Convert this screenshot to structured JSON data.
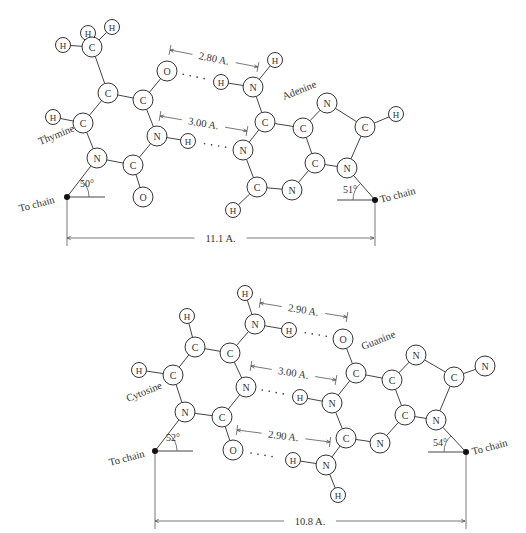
{
  "figure": {
    "top_pair": {
      "name": "thymine-adenine",
      "labels": {
        "left_base": "Thymine",
        "right_base": "Adenine"
      },
      "hbond_distances": [
        {
          "label": "2.80 A.",
          "x1": 170,
          "y1": 50,
          "x2": 258,
          "y2": 67
        },
        {
          "label": "3.00 A.",
          "x1": 160,
          "y1": 116,
          "x2": 247,
          "y2": 131
        }
      ],
      "chain_distance": {
        "label": "11.1 A.",
        "x1": 67,
        "x2": 374,
        "y": 238
      },
      "angles": [
        {
          "label": "50°",
          "x": 80,
          "y": 187
        },
        {
          "label": "51°",
          "x": 343,
          "y": 193
        }
      ],
      "chain_labels": [
        {
          "label": "To chain",
          "x": 20,
          "y": 212,
          "rot": -15
        },
        {
          "label": "To chain",
          "x": 381,
          "y": 203,
          "rot": -15
        }
      ],
      "chain_points": [
        {
          "x": 67,
          "y": 197
        },
        {
          "x": 375,
          "y": 200
        }
      ],
      "atoms": [
        {
          "id": "t_h1",
          "el": "H",
          "x": 63,
          "y": 45
        },
        {
          "id": "t_h2",
          "el": "H",
          "x": 88,
          "y": 33
        },
        {
          "id": "t_cm",
          "el": "C",
          "x": 92,
          "y": 47
        },
        {
          "id": "t_h3",
          "el": "H",
          "x": 112,
          "y": 27
        },
        {
          "id": "t_c5",
          "el": "C",
          "x": 108,
          "y": 93
        },
        {
          "id": "t_c4",
          "el": "C",
          "x": 143,
          "y": 100
        },
        {
          "id": "t_o4",
          "el": "O",
          "x": 167,
          "y": 71
        },
        {
          "id": "t_h6",
          "el": "H",
          "x": 53,
          "y": 117
        },
        {
          "id": "t_c6",
          "el": "C",
          "x": 83,
          "y": 123
        },
        {
          "id": "t_n3",
          "el": "N",
          "x": 157,
          "y": 136
        },
        {
          "id": "t_h3n",
          "el": "H",
          "x": 188,
          "y": 141
        },
        {
          "id": "t_n1",
          "el": "N",
          "x": 97,
          "y": 158
        },
        {
          "id": "t_c2",
          "el": "C",
          "x": 133,
          "y": 165
        },
        {
          "id": "t_o2",
          "el": "O",
          "x": 143,
          "y": 197
        },
        {
          "id": "a_h6a",
          "el": "H",
          "x": 221,
          "y": 82
        },
        {
          "id": "a_n6",
          "el": "N",
          "x": 253,
          "y": 87
        },
        {
          "id": "a_h6b",
          "el": "H",
          "x": 275,
          "y": 60
        },
        {
          "id": "a_c6",
          "el": "C",
          "x": 265,
          "y": 122
        },
        {
          "id": "a_n1",
          "el": "N",
          "x": 243,
          "y": 150
        },
        {
          "id": "a_c2",
          "el": "C",
          "x": 257,
          "y": 187
        },
        {
          "id": "a_h2",
          "el": "H",
          "x": 233,
          "y": 210
        },
        {
          "id": "a_n3",
          "el": "N",
          "x": 292,
          "y": 190
        },
        {
          "id": "a_c4",
          "el": "C",
          "x": 315,
          "y": 163
        },
        {
          "id": "a_c5",
          "el": "C",
          "x": 303,
          "y": 128
        },
        {
          "id": "a_n7",
          "el": "N",
          "x": 327,
          "y": 103
        },
        {
          "id": "a_c8",
          "el": "C",
          "x": 365,
          "y": 127
        },
        {
          "id": "a_h8",
          "el": "H",
          "x": 396,
          "y": 114
        },
        {
          "id": "a_n9",
          "el": "N",
          "x": 347,
          "y": 168
        }
      ],
      "bonds": [
        [
          "t_h1",
          "t_cm"
        ],
        [
          "t_h2",
          "t_cm"
        ],
        [
          "t_h3",
          "t_cm"
        ],
        [
          "t_cm",
          "t_c5"
        ],
        [
          "t_c5",
          "t_c4"
        ],
        [
          "t_c4",
          "t_o4"
        ],
        [
          "t_c5",
          "t_c6"
        ],
        [
          "t_h6",
          "t_c6"
        ],
        [
          "t_c6",
          "t_n1"
        ],
        [
          "t_c4",
          "t_n3"
        ],
        [
          "t_n3",
          "t_h3n"
        ],
        [
          "t_n3",
          "t_c2"
        ],
        [
          "t_n1",
          "t_c2"
        ],
        [
          "t_c2",
          "t_o2"
        ],
        [
          "a_h6a",
          "a_n6"
        ],
        [
          "a_n6",
          "a_h6b"
        ],
        [
          "a_n6",
          "a_c6"
        ],
        [
          "a_c6",
          "a_n1"
        ],
        [
          "a_n1",
          "a_c2"
        ],
        [
          "a_c2",
          "a_h2"
        ],
        [
          "a_c2",
          "a_n3"
        ],
        [
          "a_n3",
          "a_c4"
        ],
        [
          "a_c4",
          "a_c5"
        ],
        [
          "a_c5",
          "a_c6"
        ],
        [
          "a_c5",
          "a_n7"
        ],
        [
          "a_n7",
          "a_c8"
        ],
        [
          "a_c8",
          "a_h8"
        ],
        [
          "a_c8",
          "a_n9"
        ],
        [
          "a_n9",
          "a_c4"
        ]
      ],
      "hbonds": [
        [
          "t_o4",
          "a_h6a"
        ],
        [
          "t_h3n",
          "a_n1"
        ]
      ]
    },
    "bottom_pair": {
      "name": "cytosine-guanine",
      "labels": {
        "left_base": "Cytosine",
        "right_base": "Guanine"
      },
      "hbond_distances": [
        {
          "label": "2.90 A.",
          "x1": 260,
          "y1": 303,
          "x2": 347,
          "y2": 317
        },
        {
          "label": "3.00 A.",
          "x1": 251,
          "y1": 366,
          "x2": 336,
          "y2": 380
        },
        {
          "label": "2.90 A.",
          "x1": 237,
          "y1": 430,
          "x2": 330,
          "y2": 442
        }
      ],
      "chain_distance": {
        "label": "10.8 A.",
        "x1": 155,
        "x2": 465,
        "y": 521
      },
      "angles": [
        {
          "label": "52°",
          "x": 166,
          "y": 441
        },
        {
          "label": "54°",
          "x": 433,
          "y": 446
        }
      ],
      "chain_labels": [
        {
          "label": "To chain",
          "x": 110,
          "y": 466,
          "rot": -15
        },
        {
          "label": "To chain",
          "x": 473,
          "y": 455,
          "rot": -15
        }
      ],
      "chain_points": [
        {
          "x": 155,
          "y": 451
        },
        {
          "x": 466,
          "y": 452
        }
      ],
      "atoms": [
        {
          "id": "c_h5",
          "el": "H",
          "x": 187,
          "y": 316
        },
        {
          "id": "c_c5",
          "el": "C",
          "x": 195,
          "y": 347
        },
        {
          "id": "c_c4",
          "el": "C",
          "x": 230,
          "y": 353
        },
        {
          "id": "c_hn4a",
          "el": "H",
          "x": 245,
          "y": 293
        },
        {
          "id": "c_n4",
          "el": "N",
          "x": 255,
          "y": 324
        },
        {
          "id": "c_hn4b",
          "el": "H",
          "x": 289,
          "y": 330
        },
        {
          "id": "c_h6",
          "el": "H",
          "x": 139,
          "y": 370
        },
        {
          "id": "c_c6",
          "el": "C",
          "x": 173,
          "y": 375
        },
        {
          "id": "c_n3",
          "el": "N",
          "x": 246,
          "y": 387
        },
        {
          "id": "c_n1",
          "el": "N",
          "x": 185,
          "y": 412
        },
        {
          "id": "c_c2",
          "el": "C",
          "x": 222,
          "y": 417
        },
        {
          "id": "c_o2",
          "el": "O",
          "x": 233,
          "y": 450
        },
        {
          "id": "g_o6",
          "el": "O",
          "x": 343,
          "y": 339
        },
        {
          "id": "g_c6",
          "el": "C",
          "x": 356,
          "y": 373
        },
        {
          "id": "g_h1",
          "el": "H",
          "x": 300,
          "y": 397
        },
        {
          "id": "g_n1",
          "el": "N",
          "x": 332,
          "y": 403
        },
        {
          "id": "g_c2",
          "el": "C",
          "x": 346,
          "y": 438
        },
        {
          "id": "g_h2a",
          "el": "H",
          "x": 293,
          "y": 460
        },
        {
          "id": "g_n2",
          "el": "N",
          "x": 326,
          "y": 465
        },
        {
          "id": "g_h2b",
          "el": "H",
          "x": 338,
          "y": 495
        },
        {
          "id": "g_n3",
          "el": "N",
          "x": 380,
          "y": 443
        },
        {
          "id": "g_c4",
          "el": "C",
          "x": 405,
          "y": 415
        },
        {
          "id": "g_c5",
          "el": "C",
          "x": 392,
          "y": 380
        },
        {
          "id": "g_n7",
          "el": "N",
          "x": 416,
          "y": 355
        },
        {
          "id": "g_c8",
          "el": "C",
          "x": 454,
          "y": 377
        },
        {
          "id": "g_n8",
          "el": "N",
          "x": 485,
          "y": 366
        },
        {
          "id": "g_n9",
          "el": "N",
          "x": 436,
          "y": 420
        }
      ],
      "bonds": [
        [
          "c_h5",
          "c_c5"
        ],
        [
          "c_c5",
          "c_c4"
        ],
        [
          "c_c4",
          "c_n4"
        ],
        [
          "c_n4",
          "c_hn4a"
        ],
        [
          "c_n4",
          "c_hn4b"
        ],
        [
          "c_c5",
          "c_c6"
        ],
        [
          "c_h6",
          "c_c6"
        ],
        [
          "c_c6",
          "c_n1"
        ],
        [
          "c_c4",
          "c_n3"
        ],
        [
          "c_n3",
          "c_c2"
        ],
        [
          "c_n1",
          "c_c2"
        ],
        [
          "c_c2",
          "c_o2"
        ],
        [
          "g_o6",
          "g_c6"
        ],
        [
          "g_c6",
          "g_n1"
        ],
        [
          "g_n1",
          "g_h1"
        ],
        [
          "g_n1",
          "g_c2"
        ],
        [
          "g_c2",
          "g_n2"
        ],
        [
          "g_n2",
          "g_h2a"
        ],
        [
          "g_n2",
          "g_h2b"
        ],
        [
          "g_c2",
          "g_n3"
        ],
        [
          "g_n3",
          "g_c4"
        ],
        [
          "g_c4",
          "g_c5"
        ],
        [
          "g_c5",
          "g_c6"
        ],
        [
          "g_c5",
          "g_n7"
        ],
        [
          "g_n7",
          "g_c8"
        ],
        [
          "g_c8",
          "g_n8"
        ],
        [
          "g_c8",
          "g_n9"
        ],
        [
          "g_n9",
          "g_c4"
        ]
      ],
      "hbonds": [
        [
          "c_hn4b",
          "g_o6"
        ],
        [
          "c_n3",
          "g_h1"
        ],
        [
          "c_o2",
          "g_h2a"
        ]
      ]
    },
    "base_label_positions": {
      "Thymine": {
        "x": 40,
        "y": 145,
        "rot": -22
      },
      "Adenine": {
        "x": 284,
        "y": 100,
        "rot": -22
      },
      "Cytosine": {
        "x": 128,
        "y": 402,
        "rot": -22
      },
      "Guanine": {
        "x": 363,
        "y": 350,
        "rot": -22
      }
    },
    "colors": {
      "line": "#444444",
      "text": "#333333",
      "background": "#ffffff"
    }
  }
}
